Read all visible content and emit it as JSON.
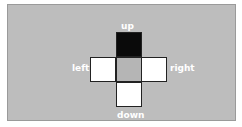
{
  "dpad": {
    "labels": {
      "up": "up",
      "left": "left",
      "right": "right",
      "down": "down"
    },
    "cells": {
      "up": {
        "state": "pressed",
        "color": "#0a0a0a"
      },
      "left": {
        "state": "released",
        "color": "#ffffff"
      },
      "center": {
        "state": "neutral",
        "color": "#b5b5b5"
      },
      "right": {
        "state": "released",
        "color": "#ffffff"
      },
      "down": {
        "state": "released",
        "color": "#ffffff"
      }
    },
    "background": "#bdbdbd"
  }
}
